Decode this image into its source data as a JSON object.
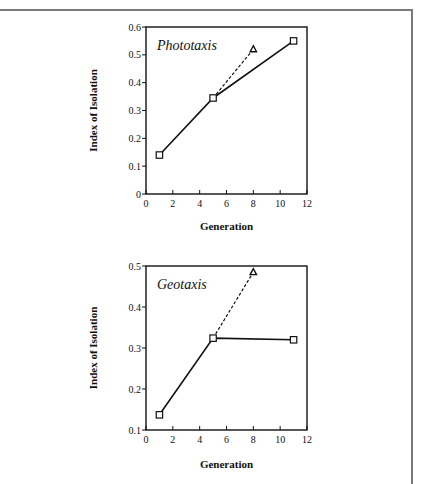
{
  "chart_data": [
    {
      "type": "line",
      "title": "Phototaxis",
      "xlabel": "Generation",
      "ylabel": "Index of Isolation",
      "xlim": [
        0,
        12
      ],
      "ylim": [
        0,
        0.6
      ],
      "xticks": [
        0,
        2,
        4,
        6,
        8,
        10,
        12
      ],
      "yticks": [
        0,
        0.1,
        0.2,
        0.3,
        0.4,
        0.5,
        0.6
      ],
      "ytick_labels": [
        "0",
        "0.1",
        "0.2",
        "0.3",
        "0.4",
        "0.5",
        "0.6"
      ],
      "grid": false,
      "series": [
        {
          "name": "solid",
          "style": "solid",
          "marker": "square",
          "x": [
            1,
            5,
            11
          ],
          "y": [
            0.14,
            0.345,
            0.55
          ]
        },
        {
          "name": "dashed",
          "style": "dashed",
          "marker": "triangle",
          "x": [
            5,
            8
          ],
          "y": [
            0.345,
            0.52
          ]
        }
      ]
    },
    {
      "type": "line",
      "title": "Geotaxis",
      "xlabel": "Generation",
      "ylabel": "Index of Isolation",
      "xlim": [
        0,
        12
      ],
      "ylim": [
        0.1,
        0.5
      ],
      "xticks": [
        0,
        2,
        4,
        6,
        8,
        10,
        12
      ],
      "yticks": [
        0.1,
        0.2,
        0.3,
        0.4,
        0.5
      ],
      "ytick_labels": [
        "0.1",
        "0.2",
        "0.3",
        "0.4",
        "0.5"
      ],
      "grid": false,
      "series": [
        {
          "name": "solid",
          "style": "solid",
          "marker": "square",
          "x": [
            1,
            5,
            11
          ],
          "y": [
            0.137,
            0.324,
            0.32
          ]
        },
        {
          "name": "dashed",
          "style": "dashed",
          "marker": "triangle",
          "x": [
            5,
            8
          ],
          "y": [
            0.324,
            0.485
          ]
        }
      ]
    }
  ],
  "layout": {
    "panels": [
      {
        "top": 27,
        "bottom": 194,
        "left": 146,
        "right": 307,
        "ylabel_x": 97,
        "xlabel_y": 230
      },
      {
        "top": 266,
        "bottom": 430,
        "left": 146,
        "right": 307,
        "ylabel_x": 97,
        "xlabel_y": 468
      }
    ]
  }
}
